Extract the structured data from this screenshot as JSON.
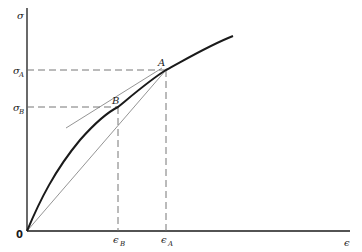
{
  "diagram": {
    "type": "stress-strain curve with secant and tangent",
    "axes": {
      "y_label": "σ",
      "x_label": "ϵ",
      "origin_label": "0"
    },
    "points": [
      {
        "name": "A",
        "label": "A",
        "stress_label": "σ",
        "stress_sub": "A",
        "strain_label": "ϵ",
        "strain_sub": "A"
      },
      {
        "name": "B",
        "label": "B",
        "stress_label": "σ",
        "stress_sub": "B",
        "strain_label": "ϵ",
        "strain_sub": "B"
      }
    ],
    "lines": [
      {
        "name": "stress-strain-curve",
        "style": "thick solid",
        "from": "0",
        "through": [
          "B",
          "A"
        ]
      },
      {
        "name": "secant-line",
        "style": "thin solid",
        "from": "0",
        "to": "A"
      },
      {
        "name": "tangent-line-at-B",
        "style": "thin solid",
        "touches": "B"
      },
      {
        "name": "guide-lines",
        "style": "dashed",
        "description": "horizontal to σ axis, vertical to ϵ axis from A and B"
      }
    ],
    "colors": {
      "ink": "#1a1a1a",
      "thin_line": "#555555",
      "dashed": "#666666",
      "background": "#ffffff"
    }
  }
}
